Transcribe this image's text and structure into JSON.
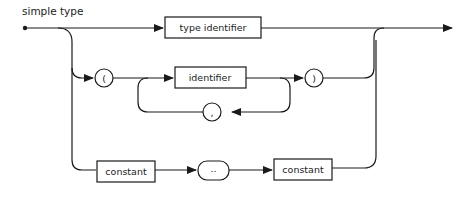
{
  "diagram": {
    "title": "simple type",
    "nodes": {
      "type_identifier": "type identifier",
      "open_paren": "(",
      "identifier": "identifier",
      "close_paren": ")",
      "comma": ",",
      "constant_1": "constant",
      "range": "..",
      "constant_2": "constant"
    },
    "colors": {
      "line": "#1a1a1a",
      "background": "#ffffff"
    }
  }
}
